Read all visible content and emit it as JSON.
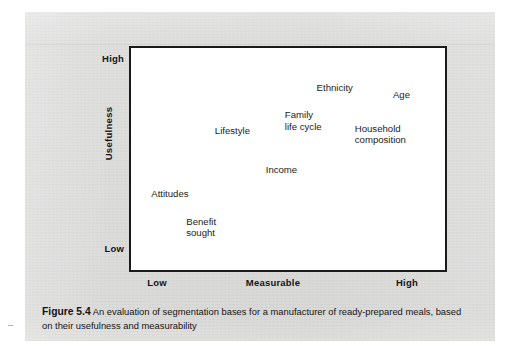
{
  "figure": {
    "caption_number": "Figure 5.4",
    "caption_text": " An evaluation of segmentation bases for a manufacturer of ready-prepared meals, based on their usefulness and measurability"
  },
  "chart_data": {
    "type": "scatter",
    "title": "An evaluation of segmentation bases for a manufacturer of ready-prepared meals, based on their usefulness and measurability",
    "xlabel": "Measurable",
    "ylabel": "Usefulness",
    "xlim": [
      0,
      1
    ],
    "ylim": [
      0,
      1
    ],
    "grid": false,
    "legend": "none",
    "x_tick_labels": [
      "Low",
      "Measurable",
      "High"
    ],
    "y_tick_labels": [
      "Low",
      "High"
    ],
    "axis_labels": {
      "x_low": "Low",
      "x_mid": "Measurable",
      "x_high": "High",
      "y_low": "Low",
      "y_high": "High",
      "y_title": "Usefulness"
    },
    "points": [
      {
        "label": "Ethnicity",
        "x": 0.59,
        "y": 0.84
      },
      {
        "label": "Age",
        "x": 0.83,
        "y": 0.81
      },
      {
        "label": "Family\nlife cycle",
        "x": 0.49,
        "y": 0.72
      },
      {
        "label": "Household\ncomposition",
        "x": 0.71,
        "y": 0.66
      },
      {
        "label": "Lifestyle",
        "x": 0.27,
        "y": 0.65
      },
      {
        "label": "Income",
        "x": 0.43,
        "y": 0.48
      },
      {
        "label": "Attitudes",
        "x": 0.07,
        "y": 0.37
      },
      {
        "label": "Benefit\nsought",
        "x": 0.18,
        "y": 0.25
      }
    ]
  },
  "style": {
    "page_background": "#dededd",
    "plot_background": "#ffffff",
    "plot_border": "#1a1a1a",
    "text_color": "#1b1b1b"
  }
}
